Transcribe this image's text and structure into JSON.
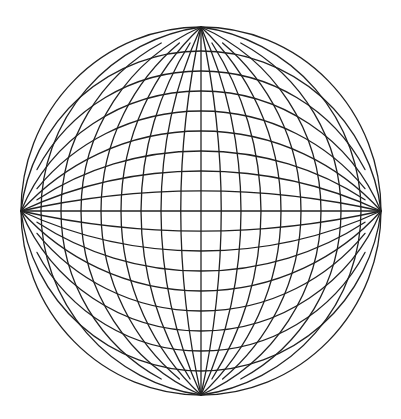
{
  "figure": {
    "title": "Sphere grid drawing",
    "background": "#ffffff",
    "stroke_color": "#222222",
    "stroke_width": 1.3
  },
  "geometry": {
    "center": [
      201,
      211
    ],
    "pole_top": [
      201,
      27
    ],
    "pole_bottom": [
      201,
      395
    ],
    "pole_left": [
      21,
      211
    ],
    "pole_right": [
      381,
      211
    ],
    "outer_radius_x": 180,
    "outer_radius_y": 184,
    "spacing": 20,
    "arcs_per_side": 8,
    "meridians_note": "vertical arcs pass through (center.x ± k·spacing, center.y), k = 0..8",
    "parallels_note": "horizontal arcs pass through (center.x, center.y ± k·spacing), k = 0..8",
    "short_arc_trim": 16
  }
}
